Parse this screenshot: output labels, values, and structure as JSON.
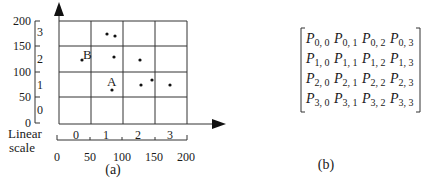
{
  "panel_a": {
    "caption": "(a)",
    "y_scale": {
      "values": [
        "200",
        "150",
        "100",
        "50",
        "0"
      ],
      "cells": [
        "3",
        "2",
        "1",
        "0"
      ]
    },
    "x_scale": {
      "title_line1": "Linear",
      "title_line2": "scale",
      "values": [
        "0",
        "50",
        "100",
        "150",
        "200"
      ],
      "cells": [
        "0",
        "1",
        "2",
        "3"
      ]
    },
    "grid": {
      "rows": 4,
      "cols": 4
    },
    "points": [
      {
        "x": 107,
        "y": 34
      },
      {
        "x": 115,
        "y": 36
      },
      {
        "x": 114,
        "y": 57
      },
      {
        "x": 140,
        "y": 60
      },
      {
        "x": 82,
        "y": 60,
        "label": "B"
      },
      {
        "x": 112,
        "y": 90,
        "label": "A"
      },
      {
        "x": 141,
        "y": 85
      },
      {
        "x": 152,
        "y": 80
      },
      {
        "x": 170,
        "y": 85
      }
    ],
    "point_labels": {
      "A": "A",
      "B": "B"
    }
  },
  "panel_b": {
    "caption": "(b)",
    "matrix": [
      [
        "0, 0",
        "0, 1",
        "0, 2",
        "0, 3"
      ],
      [
        "1, 0",
        "1, 1",
        "1, 2",
        "1, 3"
      ],
      [
        "2, 0",
        "2, 1",
        "2, 2",
        "2, 3"
      ],
      [
        "3, 0",
        "3, 1",
        "3, 2",
        "3, 3"
      ]
    ],
    "symbol": "P"
  }
}
